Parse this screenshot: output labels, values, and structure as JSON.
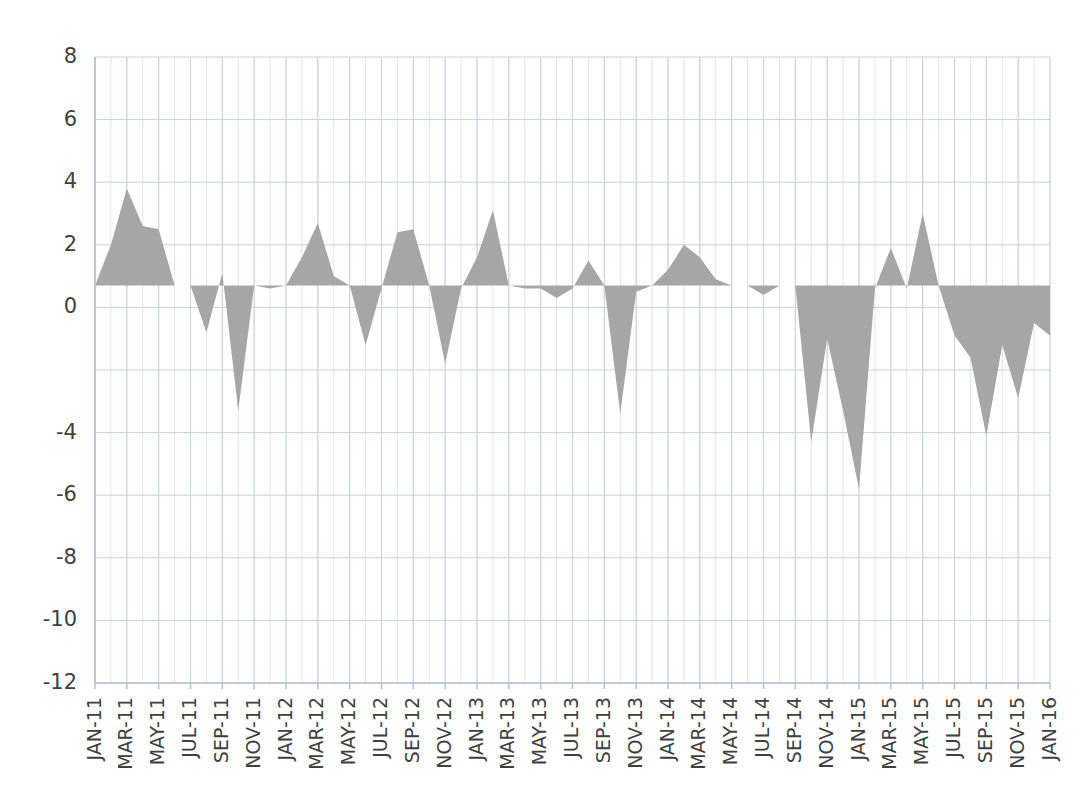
{
  "chart_data": {
    "type": "area",
    "title": "",
    "subtitle": "",
    "xlabel": "",
    "ylabel": "",
    "ylim": [
      -12,
      8
    ],
    "ytick_values": [
      8,
      6,
      4,
      2,
      0,
      -4,
      -6,
      -8,
      -10,
      -12
    ],
    "ytick_labels": [
      "8",
      "6",
      "4",
      "2",
      "0",
      "-4",
      "-6",
      "-8",
      "-10",
      "-12"
    ],
    "grid": true,
    "grid_minor_vertical": true,
    "legend": "none",
    "baseline": 0.7,
    "series_color": "#a6a6a6",
    "grid_color": "#c9cfe0",
    "axis_color": "#b9bfd0",
    "x": [
      "JAN-11",
      "FEB-11",
      "MAR-11",
      "APR-11",
      "MAY-11",
      "JUN-11",
      "JUL-11",
      "AUG-11",
      "SEP-11",
      "OCT-11",
      "NOV-11",
      "DEC-11",
      "JAN-12",
      "FEB-12",
      "MAR-12",
      "APR-12",
      "MAY-12",
      "JUN-12",
      "JUL-12",
      "AUG-12",
      "SEP-12",
      "OCT-12",
      "NOV-12",
      "DEC-12",
      "JAN-13",
      "FEB-13",
      "MAR-13",
      "APR-13",
      "MAY-13",
      "JUN-13",
      "JUL-13",
      "AUG-13",
      "SEP-13",
      "OCT-13",
      "NOV-13",
      "DEC-13",
      "JAN-14",
      "FEB-14",
      "MAR-14",
      "APR-14",
      "MAY-14",
      "JUN-14",
      "JUL-14",
      "AUG-14",
      "SEP-14",
      "OCT-14",
      "NOV-14",
      "DEC-14",
      "JAN-15",
      "FEB-15",
      "MAR-15",
      "APR-15",
      "MAY-15",
      "JUN-15",
      "JUL-15",
      "AUG-15",
      "SEP-15",
      "OCT-15",
      "NOV-15",
      "DEC-15",
      "JAN-16"
    ],
    "xtick_labels": [
      "JAN-11",
      "MAR-11",
      "MAY-11",
      "JUL-11",
      "SEP-11",
      "NOV-11",
      "JAN-12",
      "MAR-12",
      "MAY-12",
      "JUL-12",
      "SEP-12",
      "NOV-12",
      "JAN-13",
      "MAR-13",
      "MAY-13",
      "JUL-13",
      "SEP-13",
      "NOV-13",
      "JAN-14",
      "MAR-14",
      "MAY-14",
      "JUL-14",
      "SEP-14",
      "NOV-14",
      "JAN-15",
      "MAR-15",
      "MAY-15",
      "JUL-15",
      "SEP-15",
      "NOV-15",
      "JAN-16"
    ],
    "xtick_indices": [
      0,
      2,
      4,
      6,
      8,
      10,
      12,
      14,
      16,
      18,
      20,
      22,
      24,
      26,
      28,
      30,
      32,
      34,
      36,
      38,
      40,
      42,
      44,
      46,
      48,
      50,
      52,
      54,
      56,
      58,
      60
    ],
    "values": [
      0.7,
      2.0,
      3.8,
      2.6,
      2.5,
      0.7,
      0.7,
      -0.8,
      1.1,
      -3.3,
      0.7,
      0.6,
      0.7,
      1.6,
      2.7,
      1.0,
      0.7,
      -1.2,
      0.6,
      2.4,
      2.5,
      0.7,
      -1.8,
      0.6,
      1.6,
      3.1,
      0.7,
      0.6,
      0.6,
      0.3,
      0.6,
      1.5,
      0.7,
      -3.4,
      0.5,
      0.7,
      1.2,
      2.0,
      1.6,
      0.9,
      0.7,
      0.7,
      0.4,
      0.7,
      0.7,
      -4.3,
      -1.0,
      -3.3,
      -5.8,
      0.6,
      1.9,
      0.6,
      3.0,
      0.7,
      -0.9,
      -1.6,
      -4.1,
      -1.2,
      -2.9,
      -0.5,
      -0.9
    ]
  }
}
